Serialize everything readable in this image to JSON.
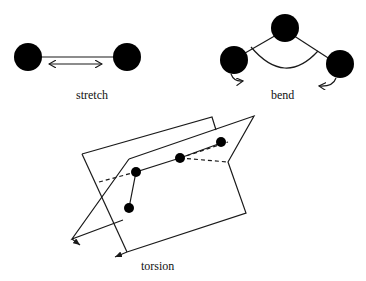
{
  "figure": {
    "panels": [
      {
        "id": "stretch",
        "label": "stretch"
      },
      {
        "id": "bend",
        "label": "bend"
      },
      {
        "id": "torsion",
        "label": "torsion"
      }
    ]
  },
  "colors": {
    "ink": "#000000",
    "background": "#ffffff"
  }
}
